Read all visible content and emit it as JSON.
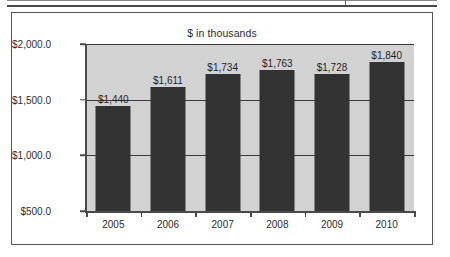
{
  "top_strip": {
    "note": "table-bottom-edge"
  },
  "chart_data": {
    "type": "bar",
    "title": "$ in thousands",
    "xlabel": "",
    "ylabel": "",
    "categories": [
      "2005",
      "2006",
      "2007",
      "2008",
      "2009",
      "2010"
    ],
    "values": [
      1440,
      1611,
      1734,
      1763,
      1728,
      1840
    ],
    "value_labels": [
      "$1,440",
      "$1,611",
      "$1,734",
      "$1,763",
      "$1,728",
      "$1,840"
    ],
    "ylim": [
      500,
      2000
    ],
    "ytick_values": [
      2000,
      1500,
      1000,
      500
    ],
    "ytick_labels": [
      "$2,000.0",
      "$1,500.0",
      "$1,000.0",
      "$500.0"
    ],
    "grid": true,
    "legend": "none",
    "colors": {
      "bar": "#333333",
      "plot_background": "#d2d2d2",
      "chart_background": "#ffffff",
      "axis": "#4a4a4a",
      "gridline": "#3a3a3a",
      "text": "#2e2e2e"
    }
  }
}
